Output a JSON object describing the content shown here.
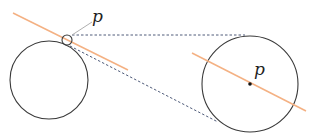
{
  "diagram": {
    "labels": {
      "point_small": "p",
      "point_magnified": "p"
    },
    "colors": {
      "circle_stroke": "#3a3a3a",
      "tangent_line": "#f4b183",
      "dashed_connector": "#3c4a6b",
      "leader_line": "#b0b0b0",
      "point_dot": "#111111"
    },
    "shapes": {
      "left_circle": {
        "cx": 49,
        "cy": 80,
        "r": 39
      },
      "magnifier_circle": {
        "cx": 67,
        "cy": 40,
        "r": 5
      },
      "right_circle": {
        "cx": 250,
        "cy": 84,
        "r": 48
      },
      "left_tangent": {
        "x1": 13,
        "y1": 13,
        "x2": 128,
        "y2": 70
      },
      "right_tangent": {
        "x1": 192,
        "y1": 53,
        "x2": 306,
        "y2": 111
      },
      "dashed_top": {
        "x1": 72,
        "y1": 35,
        "x2": 245,
        "y2": 35
      },
      "dashed_bottom": {
        "x1": 70,
        "y1": 46,
        "x2": 218,
        "y2": 122
      },
      "leader": {
        "x1": 72,
        "y1": 35,
        "x2": 92,
        "y2": 22
      }
    }
  }
}
